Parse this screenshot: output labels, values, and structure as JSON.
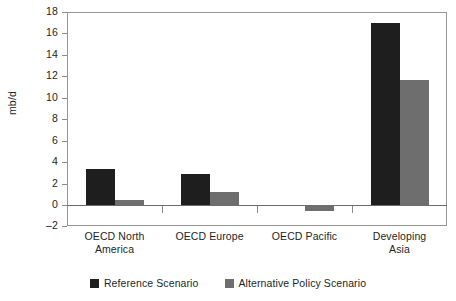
{
  "title": "",
  "axis": {
    "ylabel": "mb/d",
    "yticks": [
      "18",
      "16",
      "14",
      "12",
      "10",
      "8",
      "6",
      "4",
      "2",
      "0",
      "-2"
    ]
  },
  "legend": {
    "items": [
      {
        "label": "Reference Scenario",
        "color": "#1e1e1e",
        "swatch": "ref"
      },
      {
        "label": "Alternative Policy Scenario",
        "color": "#6e6e6e",
        "swatch": "alt"
      }
    ]
  },
  "categories_display": [
    {
      "line1": "OECD North",
      "line2": "America"
    },
    {
      "line1": "OECD Europe",
      "line2": ""
    },
    {
      "line1": "OECD Pacific",
      "line2": ""
    },
    {
      "line1": "Developing",
      "line2": "Asia"
    }
  ],
  "chart_data": {
    "type": "bar",
    "title": "",
    "xlabel": "",
    "ylabel": "mb/d",
    "ylim": [
      -2,
      18
    ],
    "ytick_step": 2,
    "grid": false,
    "legend_position": "bottom",
    "categories": [
      "OECD North America",
      "OECD Europe",
      "OECD Pacific",
      "Developing Asia"
    ],
    "series": [
      {
        "name": "Reference Scenario",
        "color": "#1e1e1e",
        "values": [
          3.35,
          2.85,
          0.0,
          17.0
        ]
      },
      {
        "name": "Alternative Policy Scenario",
        "color": "#6e6e6e",
        "values": [
          0.5,
          1.25,
          -0.55,
          11.7
        ]
      }
    ]
  }
}
